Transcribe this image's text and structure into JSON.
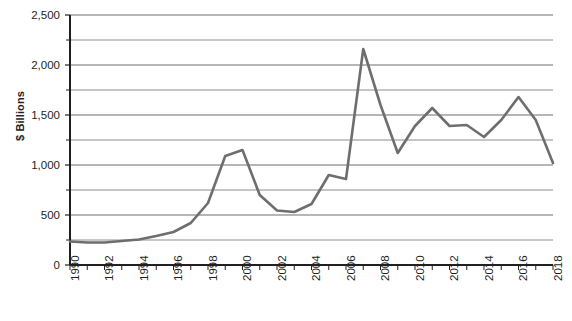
{
  "chart_data": {
    "type": "line",
    "title": "",
    "subtitle": "",
    "xlabel": "",
    "ylabel": "$ Billions",
    "ylim": [
      0,
      2500
    ],
    "xlim": [
      1990,
      2018
    ],
    "grid": true,
    "grid_axis": "y",
    "legend": false,
    "legend_position": "none",
    "y_major_ticks": [
      0,
      500,
      1000,
      1500,
      2000,
      2500
    ],
    "y_minor_ticks": [
      250,
      750,
      1250,
      1750,
      2250
    ],
    "y_tick_labels": [
      "0",
      "500",
      "1,000",
      "1,500",
      "2,000",
      "2,500"
    ],
    "x_tick_labels": [
      "1990",
      "1992",
      "1994",
      "1996",
      "1998",
      "2000",
      "2002",
      "2004",
      "2006",
      "2008",
      "2010",
      "2012",
      "2014",
      "2016",
      "2018"
    ],
    "x_tick_label_rotation": -90,
    "x_tick_step": 2,
    "x_minor_tick_step": 1,
    "line_color": "#6e6e6e",
    "line_width": 2.6,
    "axis_color": "#231f20",
    "grid_color": "#6e6e6e",
    "background": "#ffffff",
    "x": [
      1990,
      1991,
      1992,
      1993,
      1994,
      1995,
      1996,
      1997,
      1998,
      1999,
      2000,
      2001,
      2002,
      2003,
      2004,
      2005,
      2006,
      2007,
      2008,
      2009,
      2010,
      2011,
      2012,
      2013,
      2014,
      2015,
      2016,
      2017,
      2018
    ],
    "values": [
      235,
      225,
      225,
      240,
      255,
      290,
      330,
      420,
      620,
      1090,
      1150,
      700,
      545,
      530,
      610,
      900,
      860,
      2160,
      1600,
      1120,
      1390,
      1570,
      1390,
      1400,
      1280,
      1450,
      1680,
      1450,
      1020
    ],
    "series": [
      {
        "name": "",
        "values": [
          235,
          225,
          225,
          240,
          255,
          290,
          330,
          420,
          620,
          1090,
          1150,
          700,
          545,
          530,
          610,
          900,
          860,
          2160,
          1600,
          1120,
          1390,
          1570,
          1390,
          1400,
          1280,
          1450,
          1680,
          1450,
          1020
        ]
      }
    ]
  }
}
